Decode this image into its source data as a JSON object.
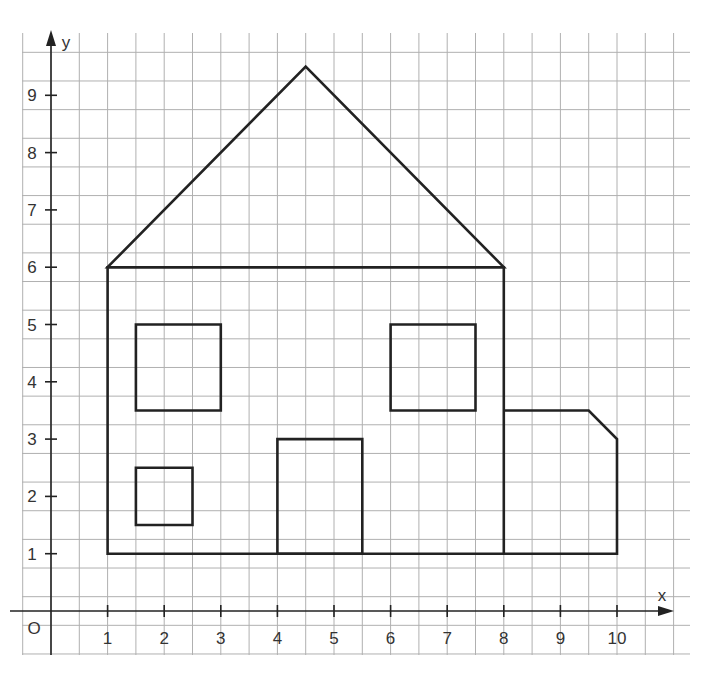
{
  "figure": {
    "title": "",
    "axes": {
      "x_label": "x",
      "y_label": "y",
      "origin_label": "O",
      "x_ticks": [
        "1",
        "2",
        "3",
        "4",
        "5",
        "6",
        "7",
        "8",
        "9",
        "10"
      ],
      "y_ticks": [
        "1",
        "2",
        "3",
        "4",
        "5",
        "6",
        "7",
        "8",
        "9"
      ],
      "grid_step": 0.5,
      "x_range": [
        -0.5,
        11.25
      ],
      "y_range": [
        -0.75,
        10
      ],
      "colors": {
        "grid": "#b0b0b0",
        "lines": "#222222",
        "text": "#333333"
      }
    },
    "shapes": [
      {
        "name": "roof",
        "type": "polygon",
        "points": [
          [
            1,
            6
          ],
          [
            4.5,
            9.5
          ],
          [
            8,
            6
          ]
        ]
      },
      {
        "name": "house-body",
        "type": "polygon",
        "points": [
          [
            1,
            1
          ],
          [
            1,
            6
          ],
          [
            8,
            6
          ],
          [
            8,
            1
          ]
        ]
      },
      {
        "name": "window-upper-left",
        "type": "polygon",
        "points": [
          [
            1.5,
            3.5
          ],
          [
            1.5,
            5
          ],
          [
            3,
            5
          ],
          [
            3,
            3.5
          ]
        ]
      },
      {
        "name": "window-lower-left",
        "type": "polygon",
        "points": [
          [
            1.5,
            1.5
          ],
          [
            1.5,
            2.5
          ],
          [
            2.5,
            2.5
          ],
          [
            2.5,
            1.5
          ]
        ]
      },
      {
        "name": "door",
        "type": "polygon",
        "points": [
          [
            4,
            1
          ],
          [
            4,
            3
          ],
          [
            5.5,
            3
          ],
          [
            5.5,
            1
          ]
        ]
      },
      {
        "name": "window-upper-right",
        "type": "polygon",
        "points": [
          [
            6,
            3.5
          ],
          [
            6,
            5
          ],
          [
            7.5,
            5
          ],
          [
            7.5,
            3.5
          ]
        ]
      },
      {
        "name": "garage",
        "type": "polyline",
        "points": [
          [
            8,
            3.5
          ],
          [
            9.5,
            3.5
          ],
          [
            10,
            3
          ],
          [
            10,
            1
          ],
          [
            8,
            1
          ]
        ]
      }
    ]
  }
}
